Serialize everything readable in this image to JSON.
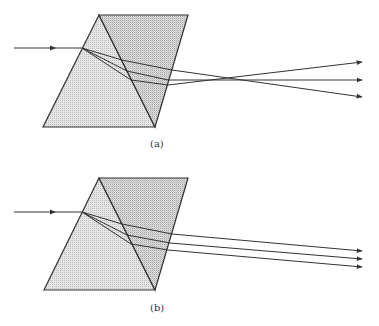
{
  "figure": {
    "panels": [
      {
        "id": "a",
        "label": "(a)",
        "description": "Compound prism pair; incident ray dispersed into three diverging/crossing rays",
        "incident_ray": {
          "from": [
            14,
            48
          ],
          "to": [
            82,
            48
          ]
        },
        "prism_left": [
          [
            99,
            15
          ],
          [
            43,
            127
          ],
          [
            155,
            127
          ]
        ],
        "prism_right": [
          [
            99,
            15
          ],
          [
            188,
            15
          ],
          [
            155,
            127
          ]
        ],
        "internal_rays": [
          [
            [
              82,
              48
            ],
            [
              122,
              60
            ],
            [
              172,
              70
            ]
          ],
          [
            [
              82,
              48
            ],
            [
              127,
              71
            ],
            [
              168,
              80
            ]
          ],
          [
            [
              82,
              48
            ],
            [
              131,
              80
            ],
            [
              168,
              85
            ]
          ]
        ],
        "exit_rays": [
          {
            "from": [
              172,
              70
            ],
            "to": [
              362,
              97
            ]
          },
          {
            "from": [
              168,
              80
            ],
            "to": [
              362,
              80
            ]
          },
          {
            "from": [
              168,
              85
            ],
            "to": [
              362,
              62
            ]
          }
        ]
      },
      {
        "id": "b",
        "label": "(b)",
        "description": "Compound prism pair; incident ray dispersed into three nearly parallel rays",
        "incident_ray": {
          "from": [
            14,
            212
          ],
          "to": [
            82,
            212
          ]
        },
        "prism_left": [
          [
            99,
            178
          ],
          [
            44,
            290
          ],
          [
            155,
            290
          ]
        ],
        "prism_right": [
          [
            99,
            178
          ],
          [
            188,
            178
          ],
          [
            155,
            290
          ]
        ],
        "internal_rays": [
          [
            [
              82,
              212
            ],
            [
              122,
              224
            ],
            [
              172,
              234
            ]
          ],
          [
            [
              82,
              212
            ],
            [
              127,
              235
            ],
            [
              170,
              243
            ]
          ],
          [
            [
              82,
              212
            ],
            [
              131,
              244
            ],
            [
              168,
              250
            ]
          ]
        ],
        "exit_rays": [
          {
            "from": [
              172,
              234
            ],
            "to": [
              362,
              251
            ]
          },
          {
            "from": [
              170,
              243
            ],
            "to": [
              362,
              259
            ]
          },
          {
            "from": [
              168,
              250
            ],
            "to": [
              362,
              267
            ]
          }
        ]
      }
    ],
    "colors": {
      "stroke": "#333333",
      "prism_left_fill": "#e4e4e4",
      "prism_right_fill": "#cfcfcf"
    }
  }
}
